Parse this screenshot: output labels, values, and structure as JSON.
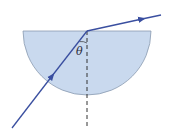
{
  "diagram": {
    "angle_label": "θ",
    "colors": {
      "block_fill": "#c9d9ee",
      "block_stroke": "#8a9bb0",
      "ray": "#3a4fa0",
      "normal": "#333333"
    },
    "elements": {
      "block": "semicircular block, flat face up",
      "incident_ray": "enters through curved surface toward center of flat face",
      "refracted_ray": "exits flat face bending away from normal",
      "normal": "dashed vertical line through point of incidence"
    }
  }
}
